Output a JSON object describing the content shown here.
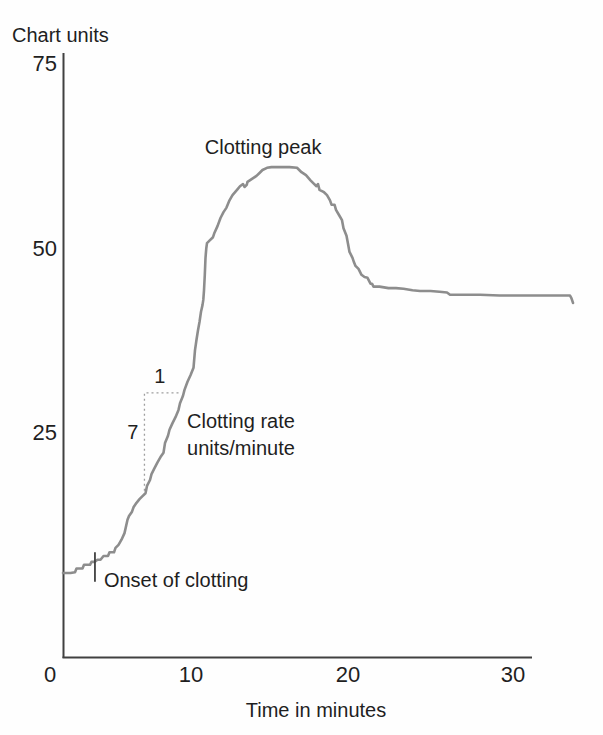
{
  "chart_data": {
    "type": "line",
    "title": "",
    "ylabel": "Chart units",
    "xlabel": "Time in minutes",
    "xlim": [
      0,
      34
    ],
    "ylim": [
      0,
      75
    ],
    "grid": false,
    "legend": "none",
    "x_ticks": [
      {
        "label": "0",
        "value": 0
      },
      {
        "label": "10",
        "value": 10
      },
      {
        "label": "20",
        "value": 20
      },
      {
        "label": "30",
        "value": 30
      }
    ],
    "y_ticks": [
      {
        "label": "75",
        "value": 75
      },
      {
        "label": "50",
        "value": 50
      },
      {
        "label": "25",
        "value": 25
      }
    ],
    "series": [
      {
        "name": "clotting-signal",
        "color": "#8d8d8d",
        "points": [
          [
            0,
            5.9
          ],
          [
            0.5,
            5.9
          ],
          [
            0.8,
            6.0
          ],
          [
            0.9,
            6.5
          ],
          [
            1.3,
            6.5
          ],
          [
            1.4,
            7.0
          ],
          [
            1.8,
            7.0
          ],
          [
            1.9,
            7.4
          ],
          [
            2.1,
            7.4
          ],
          [
            2.3,
            7.7
          ],
          [
            2.5,
            7.7
          ],
          [
            2.7,
            8.2
          ],
          [
            3.0,
            8.2
          ],
          [
            3.1,
            8.7
          ],
          [
            3.4,
            8.7
          ],
          [
            3.5,
            9.3
          ],
          [
            3.7,
            9.7
          ],
          [
            3.9,
            10.4
          ],
          [
            4.1,
            11.3
          ],
          [
            4.3,
            13.1
          ],
          [
            4.4,
            13.6
          ],
          [
            4.6,
            14.2
          ],
          [
            4.7,
            14.8
          ],
          [
            4.9,
            15.4
          ],
          [
            5.1,
            15.9
          ],
          [
            5.3,
            16.3
          ],
          [
            5.5,
            16.7
          ],
          [
            5.6,
            17.7
          ],
          [
            5.8,
            18.5
          ],
          [
            5.9,
            19.3
          ],
          [
            6.1,
            20.1
          ],
          [
            6.3,
            20.9
          ],
          [
            6.5,
            21.6
          ],
          [
            6.7,
            22.2
          ],
          [
            6.8,
            23.5
          ],
          [
            7.0,
            24.5
          ],
          [
            7.1,
            25.3
          ],
          [
            7.3,
            26.2
          ],
          [
            7.5,
            27.0
          ],
          [
            7.7,
            28.0
          ],
          [
            7.8,
            28.9
          ],
          [
            8.0,
            29.9
          ],
          [
            8.1,
            30.7
          ],
          [
            8.3,
            31.8
          ],
          [
            8.5,
            32.7
          ],
          [
            8.7,
            33.7
          ],
          [
            8.8,
            36.1
          ],
          [
            8.9,
            37.5
          ],
          [
            9.0,
            38.8
          ],
          [
            9.1,
            39.9
          ],
          [
            9.2,
            41.3
          ],
          [
            9.3,
            42.2
          ],
          [
            9.35,
            42.9
          ],
          [
            9.4,
            44.2
          ],
          [
            9.45,
            46.3
          ],
          [
            9.5,
            48.6
          ],
          [
            9.55,
            49.9
          ],
          [
            9.6,
            50.6
          ],
          [
            9.8,
            51.0
          ],
          [
            10.0,
            51.4
          ],
          [
            10.1,
            52.0
          ],
          [
            10.3,
            52.9
          ],
          [
            10.5,
            54.0
          ],
          [
            10.7,
            54.8
          ],
          [
            10.9,
            55.4
          ],
          [
            11.1,
            56.4
          ],
          [
            11.3,
            57.1
          ],
          [
            11.6,
            57.8
          ],
          [
            11.8,
            58.3
          ],
          [
            12.0,
            58.6
          ],
          [
            12.1,
            58.2
          ],
          [
            12.25,
            58.5
          ],
          [
            12.3,
            58.9
          ],
          [
            12.6,
            59.3
          ],
          [
            12.9,
            59.7
          ],
          [
            13.1,
            60.1
          ],
          [
            13.3,
            60.5
          ],
          [
            13.6,
            60.8
          ],
          [
            13.9,
            60.9
          ],
          [
            14.5,
            60.9
          ],
          [
            15.1,
            60.9
          ],
          [
            15.6,
            60.8
          ],
          [
            15.9,
            60.2
          ],
          [
            16.2,
            59.8
          ],
          [
            16.5,
            59.1
          ],
          [
            16.7,
            58.7
          ],
          [
            16.9,
            58.3
          ],
          [
            17.0,
            58.6
          ],
          [
            17.1,
            57.8
          ],
          [
            17.4,
            57.5
          ],
          [
            17.6,
            57.1
          ],
          [
            17.8,
            56.4
          ],
          [
            17.9,
            55.8
          ],
          [
            18.1,
            55.8
          ],
          [
            18.2,
            55.1
          ],
          [
            18.4,
            54.4
          ],
          [
            18.6,
            53.7
          ],
          [
            18.7,
            52.6
          ],
          [
            18.9,
            51.6
          ],
          [
            19.0,
            50.5
          ],
          [
            19.1,
            49.4
          ],
          [
            19.3,
            48.6
          ],
          [
            19.4,
            48.0
          ],
          [
            19.5,
            47.5
          ],
          [
            19.7,
            47.1
          ],
          [
            19.8,
            46.7
          ],
          [
            19.9,
            46.3
          ],
          [
            20.1,
            46.0
          ],
          [
            20.3,
            45.9
          ],
          [
            20.5,
            45.1
          ],
          [
            20.6,
            45.1
          ],
          [
            20.7,
            44.7
          ],
          [
            21.1,
            44.7
          ],
          [
            21.7,
            44.5
          ],
          [
            22.2,
            44.5
          ],
          [
            22.7,
            44.4
          ],
          [
            23.3,
            44.2
          ],
          [
            23.8,
            44.1
          ],
          [
            24.5,
            44.1
          ],
          [
            25.1,
            44.0
          ],
          [
            25.6,
            43.9
          ],
          [
            25.8,
            43.6
          ],
          [
            26.5,
            43.6
          ],
          [
            27.8,
            43.6
          ],
          [
            29.1,
            43.5
          ],
          [
            30.5,
            43.5
          ],
          [
            31.8,
            43.5
          ],
          [
            33.1,
            43.5
          ],
          [
            33.8,
            43.5
          ],
          [
            33.9,
            43.1
          ],
          [
            34.0,
            42.5
          ]
        ]
      }
    ],
    "annotations": [
      {
        "id": "clotting-peak-label",
        "lines": [
          "Clotting peak"
        ],
        "t": 9.45,
        "v": 62.7,
        "anchor": "start"
      },
      {
        "id": "clotting-rate-label",
        "lines": [
          "Clotting rate",
          "units/minute"
        ],
        "t": 8.27,
        "v": 25.5,
        "anchor": "start"
      },
      {
        "id": "onset-label",
        "lines": [
          "Onset of clotting"
        ],
        "t": 2.73,
        "v": 4.0,
        "anchor": "start"
      },
      {
        "id": "slope-run-label",
        "lines": [
          "1"
        ],
        "t": 6.45,
        "v": 31.7,
        "anchor": "middle"
      },
      {
        "id": "slope-rise-label",
        "lines": [
          "7"
        ],
        "t": 4.65,
        "v": 24.1,
        "anchor": "middle"
      }
    ],
    "onset_tick": {
      "t": 2.13,
      "v_top": 8.7,
      "v_bottom": 4.7
    },
    "slope_indicator": {
      "t_start": 5.43,
      "t_end": 7.7,
      "v_top": 30.3,
      "v_bottom": 16.6,
      "run_label": "1",
      "rise_label": "7"
    },
    "colors": {
      "curve": "#8d8d8d",
      "axis": "#404040",
      "text": "#1f1f1f",
      "dashed": "#9e9e9e"
    }
  }
}
